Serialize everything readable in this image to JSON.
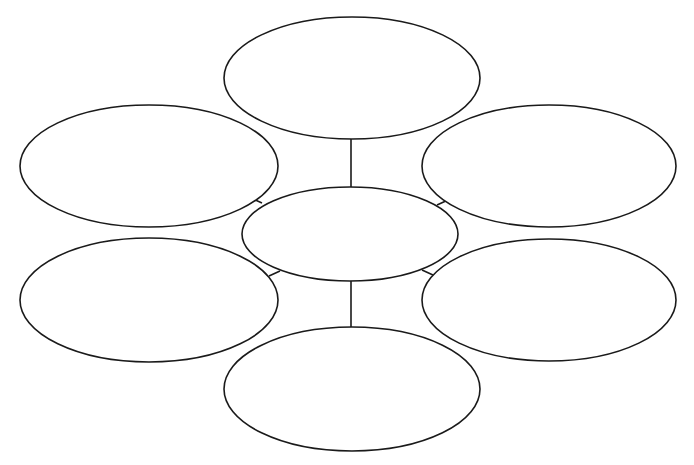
{
  "diagram": {
    "type": "bubble-map",
    "stroke_color": "#1a1a1a",
    "background": "#ffffff",
    "center": {
      "label": "",
      "cx": 350,
      "cy": 234,
      "rx": 108,
      "ry": 47
    },
    "nodes": [
      {
        "id": "top",
        "label": "",
        "cx": 352,
        "cy": 78,
        "rx": 128,
        "ry": 61
      },
      {
        "id": "upper-left",
        "label": "",
        "cx": 149,
        "cy": 166,
        "rx": 129,
        "ry": 61
      },
      {
        "id": "upper-right",
        "label": "",
        "cx": 549,
        "cy": 166,
        "rx": 127,
        "ry": 61
      },
      {
        "id": "lower-left",
        "label": "",
        "cx": 149,
        "cy": 300,
        "rx": 129,
        "ry": 62
      },
      {
        "id": "lower-right",
        "label": "",
        "cx": 549,
        "cy": 300,
        "rx": 127,
        "ry": 61
      },
      {
        "id": "bottom",
        "label": "",
        "cx": 352,
        "cy": 389,
        "rx": 128,
        "ry": 62
      }
    ],
    "connectors": [
      {
        "from": "center",
        "to": "top",
        "x1": 351,
        "y1": 187,
        "x2": 351,
        "y2": 139
      },
      {
        "from": "center",
        "to": "bottom",
        "x1": 351,
        "y1": 281,
        "x2": 351,
        "y2": 327
      },
      {
        "from": "center",
        "to": "upper-left",
        "x1": 262,
        "y1": 203,
        "x2": 251,
        "y2": 198
      },
      {
        "from": "center",
        "to": "upper-right",
        "x1": 437,
        "y1": 205,
        "x2": 448,
        "y2": 200
      },
      {
        "from": "center",
        "to": "lower-left",
        "x1": 269,
        "y1": 276,
        "x2": 280,
        "y2": 271
      },
      {
        "from": "center",
        "to": "lower-right",
        "x1": 422,
        "y1": 270,
        "x2": 433,
        "y2": 275
      }
    ]
  }
}
